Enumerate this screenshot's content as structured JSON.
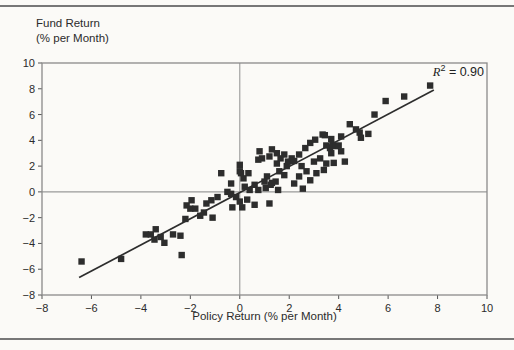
{
  "figure": {
    "y_axis_title_line1": "Fund Return",
    "y_axis_title_line2": "(% per Month)",
    "x_axis_title": "Policy Return (% per Month)",
    "r2": {
      "symbol": "R",
      "exponent": "2",
      "rest": " = 0.90"
    }
  },
  "chart_data": {
    "type": "scatter",
    "title": "",
    "xlabel": "Policy Return (% per Month)",
    "ylabel": "Fund Return (% per Month)",
    "xlim": [
      -8,
      10
    ],
    "ylim": [
      -8,
      10
    ],
    "x_ticks": [
      -8,
      -6,
      -4,
      -2,
      0,
      2,
      4,
      6,
      8,
      10
    ],
    "y_ticks": [
      10,
      8,
      6,
      4,
      2,
      0,
      -2,
      -4,
      -6,
      -8
    ],
    "r_squared": 0.9,
    "annotation": "R2 = 0.90",
    "legend": "none",
    "grid": "zero-lines-only",
    "marker": "filled-square",
    "colors": {
      "marker": "#2d2d2d",
      "trend_line": "#2d2d2d",
      "frame": "#8a8a8a",
      "zero_line": "#9a9a9a",
      "paper": "#fbfaf7"
    },
    "trend_line": {
      "x1": -6.5,
      "y1": -6.65,
      "x2": 7.85,
      "y2": 7.9
    },
    "points": [
      [
        -6.4,
        -5.4
      ],
      [
        -4.8,
        -5.2
      ],
      [
        -3.8,
        -3.3
      ],
      [
        -3.6,
        -3.3
      ],
      [
        -3.4,
        -2.9
      ],
      [
        -3.45,
        -3.7
      ],
      [
        -3.2,
        -3.5
      ],
      [
        -3.05,
        -3.95
      ],
      [
        -2.7,
        -3.3
      ],
      [
        -2.4,
        -3.4
      ],
      [
        -2.35,
        -4.9
      ],
      [
        -2.2,
        -2.1
      ],
      [
        -2.15,
        -1.05
      ],
      [
        -2.0,
        -1.3
      ],
      [
        -1.95,
        -0.65
      ],
      [
        -1.8,
        -1.3
      ],
      [
        -1.6,
        -1.85
      ],
      [
        -1.45,
        -1.6
      ],
      [
        -1.35,
        -0.9
      ],
      [
        -1.15,
        -0.65
      ],
      [
        -1.1,
        -2.0
      ],
      [
        -0.9,
        -0.4
      ],
      [
        -0.75,
        1.45
      ],
      [
        -0.5,
        0.0
      ],
      [
        -0.35,
        0.65
      ],
      [
        -0.35,
        -0.15
      ],
      [
        -0.3,
        -1.2
      ],
      [
        -0.15,
        -0.4
      ],
      [
        0.0,
        2.1
      ],
      [
        0.0,
        1.6
      ],
      [
        0.05,
        1.45
      ],
      [
        0.0,
        -0.75
      ],
      [
        0.1,
        -1.2
      ],
      [
        0.15,
        1.05
      ],
      [
        0.2,
        0.4
      ],
      [
        0.3,
        -0.6
      ],
      [
        0.35,
        1.45
      ],
      [
        0.4,
        0.15
      ],
      [
        0.6,
        -1.0
      ],
      [
        0.6,
        0.55
      ],
      [
        0.75,
        0.15
      ],
      [
        0.75,
        2.5
      ],
      [
        0.8,
        3.15
      ],
      [
        0.9,
        2.6
      ],
      [
        1.0,
        0.8
      ],
      [
        1.05,
        0.3
      ],
      [
        1.1,
        1.2
      ],
      [
        1.2,
        2.75
      ],
      [
        1.25,
        0.55
      ],
      [
        1.2,
        -0.9
      ],
      [
        1.3,
        0.7
      ],
      [
        1.3,
        3.3
      ],
      [
        1.45,
        0.8
      ],
      [
        1.5,
        2.2
      ],
      [
        1.5,
        3.0
      ],
      [
        1.55,
        0.15
      ],
      [
        1.6,
        1.6
      ],
      [
        1.65,
        2.6
      ],
      [
        1.8,
        1.3
      ],
      [
        1.8,
        2.9
      ],
      [
        1.9,
        2.0
      ],
      [
        1.95,
        2.35
      ],
      [
        2.1,
        2.6
      ],
      [
        2.2,
        0.65
      ],
      [
        2.2,
        2.4
      ],
      [
        2.4,
        1.2
      ],
      [
        2.4,
        2.9
      ],
      [
        2.5,
        2.0
      ],
      [
        2.55,
        0.25
      ],
      [
        2.65,
        3.4
      ],
      [
        2.7,
        1.6
      ],
      [
        2.85,
        0.9
      ],
      [
        2.85,
        3.8
      ],
      [
        3.0,
        2.35
      ],
      [
        3.05,
        4.05
      ],
      [
        3.1,
        1.45
      ],
      [
        3.25,
        2.6
      ],
      [
        3.35,
        4.45
      ],
      [
        3.44,
        4.4
      ],
      [
        3.4,
        1.7
      ],
      [
        3.5,
        2.2
      ],
      [
        3.5,
        3.6
      ],
      [
        3.65,
        3.4
      ],
      [
        3.7,
        3.0
      ],
      [
        3.7,
        4.1
      ],
      [
        3.75,
        3.65
      ],
      [
        3.8,
        2.25
      ],
      [
        3.9,
        3.55
      ],
      [
        4.0,
        3.6
      ],
      [
        4.1,
        4.3
      ],
      [
        4.1,
        3.15
      ],
      [
        4.25,
        2.35
      ],
      [
        4.45,
        5.25
      ],
      [
        4.7,
        4.85
      ],
      [
        4.85,
        4.6
      ],
      [
        4.9,
        4.2
      ],
      [
        5.2,
        4.5
      ],
      [
        5.45,
        6.0
      ],
      [
        5.9,
        7.05
      ],
      [
        6.65,
        7.4
      ],
      [
        7.7,
        8.25
      ]
    ]
  }
}
